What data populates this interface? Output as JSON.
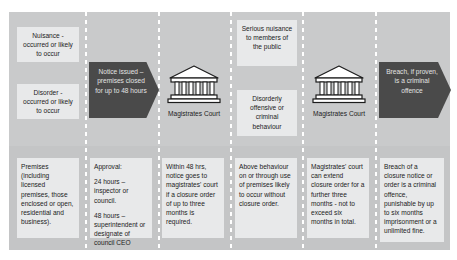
{
  "diagram": {
    "background_color": "#c9cacb",
    "card_color": "#e8e9ea",
    "arrow_color": "#4a4a4a",
    "columns": [
      {
        "id": "column-triggers",
        "top_cards": [
          {
            "id": "card-nuisance",
            "text": "Nuisance - occurred or likely to occur"
          },
          {
            "id": "card-disorder",
            "text": "Disorder - occurred or likely to occur"
          }
        ],
        "bottom_card": {
          "id": "card-premises",
          "paragraphs": [
            "Premises (including licensed premises, those enclosed or open, residential and business)."
          ]
        }
      },
      {
        "id": "column-notice",
        "arrow": {
          "id": "arrow-notice-issued",
          "text": "Notice issued – premises closed for up to 48 hours"
        },
        "bottom_card": {
          "id": "card-approval",
          "paragraphs": [
            "Approval:",
            "24 hours – inspector or council.",
            "48 hours – superintendent or designate of council CEO"
          ]
        }
      },
      {
        "id": "column-court-first",
        "court": {
          "id": "court-first",
          "icon": "courthouse-icon",
          "label": "Magistrates Court"
        },
        "bottom_card": {
          "id": "card-within-48-hrs",
          "paragraphs": [
            "Within 48 hrs, notice goes to magistrates' court if a closure order of up to three months is required."
          ]
        }
      },
      {
        "id": "column-behaviour",
        "top_cards": [
          {
            "id": "card-serious-nuisance",
            "text": "Serious nuisance to members of the public"
          },
          {
            "id": "card-disorderly",
            "text": "Disorderly offensive or criminal behaviour"
          }
        ],
        "bottom_card": {
          "id": "card-above-behaviour",
          "paragraphs": [
            "Above behaviour on or through use of premises likely to occur without closure order."
          ]
        }
      },
      {
        "id": "column-court-second",
        "court": {
          "id": "court-second",
          "icon": "courthouse-icon",
          "label": "Magistrates Court"
        },
        "bottom_card": {
          "id": "card-extend-closure",
          "paragraphs": [
            "Magistrates' court can extend closure order for a further three months - not to exceed six months in total."
          ]
        }
      },
      {
        "id": "column-breach",
        "arrow": {
          "id": "arrow-breach",
          "text": "Breach, if proven, is a criminal offence"
        },
        "bottom_card": {
          "id": "card-breach-penalty",
          "paragraphs": [
            "Breach of a closure notice or order is a criminal offence, punishable by up to six months imprisonment or a unlimited fine."
          ]
        }
      }
    ]
  }
}
